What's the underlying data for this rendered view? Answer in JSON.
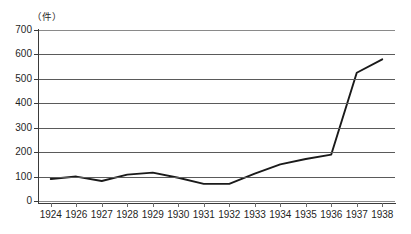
{
  "chart_data": {
    "type": "line",
    "title": "",
    "subtitle": "",
    "unit_label": "（件）",
    "xlabel": "",
    "ylabel": "",
    "ylim": [
      0,
      700
    ],
    "ytick_values": [
      0,
      100,
      200,
      300,
      400,
      500,
      600,
      700
    ],
    "ytick_labels": [
      "0",
      "100",
      "200",
      "300",
      "400",
      "500",
      "600",
      "700"
    ],
    "grid": true,
    "grid_axis": "y",
    "legend": false,
    "legend_position": "none",
    "categories": [
      "1924",
      "1926",
      "1927",
      "1928",
      "1929",
      "1930",
      "1931",
      "1932",
      "1933",
      "1934",
      "1935",
      "1936",
      "1937",
      "1938"
    ],
    "x": [
      1924,
      1926,
      1927,
      1928,
      1929,
      1930,
      1931,
      1932,
      1933,
      1934,
      1935,
      1936,
      1937,
      1938
    ],
    "values": [
      90,
      100,
      82,
      108,
      116,
      95,
      70,
      70,
      112,
      150,
      172,
      190,
      525,
      580
    ],
    "series": [
      {
        "name": "件数",
        "color": "#1a1a1a",
        "values": [
          90,
          100,
          82,
          108,
          116,
          95,
          70,
          70,
          112,
          150,
          172,
          190,
          525,
          580
        ]
      }
    ],
    "annotations": []
  },
  "style": {
    "line_color": "#1a1a1a",
    "grid_color": "#5a5a5a",
    "axis_color": "#3a3a3a",
    "text_color": "#1f1f1f",
    "background": "#ffffff"
  }
}
